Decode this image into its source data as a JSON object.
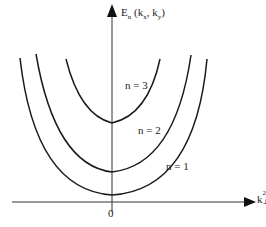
{
  "diagram": {
    "y_axis_label": {
      "main": "E",
      "sub": "n",
      "args": " (k",
      "kx": "x",
      "sep": ", k",
      "ky": "y",
      "close": ")"
    },
    "x_axis_label": {
      "main": "k",
      "sup": "2",
      "sub": "⊥"
    },
    "origin_label": "0",
    "curves": [
      {
        "label": "n = 3",
        "min_y": 123,
        "left_top": [
          66,
          59
        ],
        "right_top": [
          160,
          59
        ]
      },
      {
        "label": "n = 2",
        "min_y": 172,
        "left_top": [
          36,
          54
        ],
        "right_top": [
          191,
          55
        ]
      },
      {
        "label": "n = 1",
        "min_y": 195,
        "left_top": [
          20,
          58
        ],
        "right_top": [
          207,
          59
        ]
      }
    ],
    "color": "#1a1a1a"
  }
}
